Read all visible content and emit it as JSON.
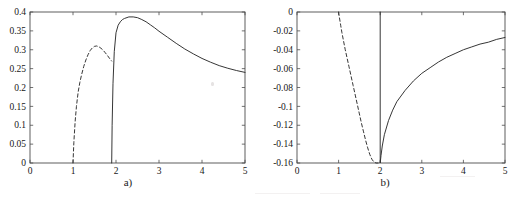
{
  "figure": {
    "panel_count": 2,
    "background_color": "#ffffff",
    "axis_color": "#4d4d4d",
    "curve_color": "#2b2b2b"
  },
  "panels": [
    {
      "id": "a",
      "caption": "a)"
    },
    {
      "id": "b",
      "caption": "b)"
    }
  ],
  "chart_data": [
    {
      "type": "line",
      "title": "",
      "panel_label": "a)",
      "xlabel": "",
      "ylabel": "",
      "xlim": [
        0,
        5
      ],
      "ylim": [
        0,
        0.4
      ],
      "xticks": [
        0,
        1,
        2,
        3,
        4,
        5
      ],
      "xticklabels": [
        "0",
        "1",
        "2",
        "3",
        "4",
        "5"
      ],
      "yticks": [
        0,
        0.05,
        0.1,
        0.15,
        0.2,
        0.25,
        0.3,
        0.35,
        0.4
      ],
      "yticklabels": [
        "0",
        "0.05",
        "0.1",
        "0.15",
        "0.2",
        "0.25",
        "0.3",
        "0.35",
        "0.4"
      ],
      "grid": false,
      "legend": "none",
      "series": [
        {
          "name": "dashed-branch",
          "style": "dashed",
          "color": "#2b2b2b",
          "x": [
            1.0,
            1.02,
            1.05,
            1.08,
            1.12,
            1.16,
            1.2,
            1.25,
            1.3,
            1.35,
            1.4,
            1.45,
            1.5,
            1.55,
            1.6,
            1.65,
            1.7,
            1.75,
            1.8,
            1.85,
            1.9
          ],
          "y": [
            0.0,
            0.055,
            0.11,
            0.15,
            0.188,
            0.214,
            0.234,
            0.256,
            0.273,
            0.287,
            0.298,
            0.305,
            0.309,
            0.31,
            0.308,
            0.304,
            0.299,
            0.292,
            0.285,
            0.277,
            0.27
          ]
        },
        {
          "name": "solid-branch",
          "style": "solid",
          "color": "#2b2b2b",
          "x": [
            1.9,
            1.91,
            1.93,
            1.96,
            2.0,
            2.05,
            2.1,
            2.15,
            2.2,
            2.3,
            2.4,
            2.5,
            2.6,
            2.7,
            2.8,
            2.9,
            3.0,
            3.2,
            3.4,
            3.6,
            3.8,
            4.0,
            4.2,
            4.4,
            4.6,
            4.8,
            5.0
          ],
          "y": [
            0.0,
            0.1,
            0.21,
            0.295,
            0.345,
            0.365,
            0.374,
            0.38,
            0.383,
            0.387,
            0.387,
            0.385,
            0.38,
            0.374,
            0.366,
            0.358,
            0.349,
            0.333,
            0.317,
            0.302,
            0.289,
            0.277,
            0.267,
            0.258,
            0.251,
            0.245,
            0.24
          ]
        }
      ]
    },
    {
      "type": "line",
      "title": "",
      "panel_label": "b)",
      "xlabel": "",
      "ylabel": "",
      "xlim": [
        0,
        5
      ],
      "ylim": [
        -0.16,
        0
      ],
      "xticks": [
        0,
        1,
        2,
        3,
        4,
        5
      ],
      "xticklabels": [
        "0",
        "1",
        "2",
        "3",
        "4",
        "5"
      ],
      "yticks": [
        -0.16,
        -0.14,
        -0.12,
        -0.1,
        -0.08,
        -0.06,
        -0.04,
        -0.02,
        0
      ],
      "yticklabels": [
        "-0.16",
        "-0.14",
        "-0.12",
        "-0.1",
        "-0.08",
        "-0.06",
        "-0.04",
        "-0.02",
        "0"
      ],
      "grid": false,
      "legend": "none",
      "series": [
        {
          "name": "dashed-branch",
          "style": "dashed",
          "color": "#2b2b2b",
          "x": [
            1.0,
            1.02,
            1.05,
            1.08,
            1.12,
            1.16,
            1.2,
            1.25,
            1.3,
            1.35,
            1.4,
            1.45,
            1.5,
            1.55,
            1.6,
            1.65,
            1.7,
            1.75,
            1.8,
            1.85,
            1.9,
            1.95
          ],
          "y": [
            0.0,
            -0.006,
            -0.014,
            -0.022,
            -0.031,
            -0.04,
            -0.048,
            -0.058,
            -0.068,
            -0.078,
            -0.088,
            -0.098,
            -0.108,
            -0.118,
            -0.127,
            -0.136,
            -0.144,
            -0.151,
            -0.156,
            -0.159,
            -0.16,
            -0.16
          ]
        },
        {
          "name": "solid-branch",
          "style": "solid",
          "color": "#2b2b2b",
          "x": [
            2.0,
            2.0,
            2.02,
            2.05,
            2.1,
            2.2,
            2.3,
            2.4,
            2.5,
            2.6,
            2.8,
            3.0,
            3.2,
            3.4,
            3.6,
            3.8,
            4.0,
            4.2,
            4.4,
            4.6,
            4.8,
            5.0
          ],
          "y": [
            0.0,
            -0.16,
            -0.152,
            -0.142,
            -0.13,
            -0.115,
            -0.104,
            -0.095,
            -0.089,
            -0.083,
            -0.073,
            -0.065,
            -0.059,
            -0.053,
            -0.048,
            -0.044,
            -0.04,
            -0.037,
            -0.034,
            -0.032,
            -0.029,
            -0.027
          ]
        }
      ]
    }
  ]
}
